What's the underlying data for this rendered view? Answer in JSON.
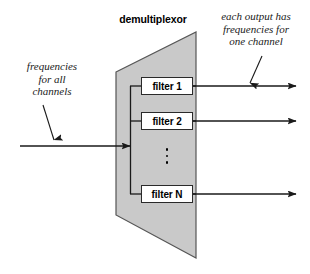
{
  "diagram": {
    "title": "demultiplexor",
    "notes": {
      "left": [
        "frequencies",
        "for all",
        "channels"
      ],
      "right": [
        "each output has",
        "frequencies for",
        "one channel"
      ]
    },
    "filters": [
      {
        "label": "filter 1"
      },
      {
        "label": "filter 2"
      },
      {
        "label": "filter N"
      }
    ],
    "ellipsis": "⋮",
    "colors": {
      "body_fill": "#c9c9c9",
      "body_stroke": "#555555",
      "line": "#1a1a1a",
      "box_fill": "#ffffff",
      "box_stroke": "#2a2a2a",
      "text": "#000000"
    }
  }
}
